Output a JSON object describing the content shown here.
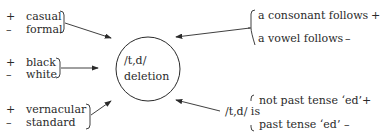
{
  "diagram": {
    "center": {
      "line1": "/t,d/",
      "line2": "deletion"
    },
    "factors": {
      "style": {
        "plus_sign": "+",
        "plus_label": "casual",
        "minus_sign": "–",
        "minus_label": "formal"
      },
      "ethnicity": {
        "plus_sign": "+",
        "plus_label": "black",
        "minus_sign": "–",
        "minus_label": "white"
      },
      "dialect": {
        "plus_sign": "+",
        "plus_label": "vernacular",
        "minus_sign": "–",
        "minus_label": "standard"
      },
      "following_segment": {
        "plus_label": "a consonant follows",
        "plus_sign": "+",
        "minus_label": "a vowel follows",
        "minus_sign": "–"
      },
      "grammatical_status": {
        "prefix": "/t,d/ is",
        "plus_label": "not past tense ‘ed’",
        "plus_sign": "+",
        "minus_label": "past tense ‘ed’",
        "minus_sign": "–"
      }
    }
  }
}
